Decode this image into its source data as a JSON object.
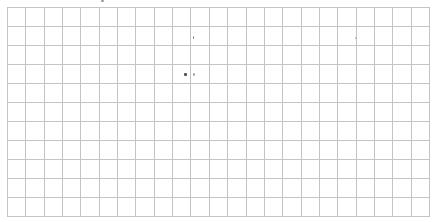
{
  "canvas": {
    "width": 434,
    "height": 222,
    "background": "#ffffff"
  },
  "grid": {
    "line_color": "#c4c4c4",
    "origin_x": 7,
    "origin_y": 7,
    "end_x": 429,
    "end_y": 216,
    "columns": 23,
    "rows": 11
  },
  "marks": [
    {
      "x": 101,
      "y": 0,
      "w": 3,
      "h": 2,
      "color": "#9a9a9a"
    },
    {
      "x": 193,
      "y": 36,
      "w": 1,
      "h": 3,
      "color": "#8a8a8a"
    },
    {
      "x": 355,
      "y": 37,
      "w": 2,
      "h": 2,
      "color": "#b5b5b5"
    },
    {
      "x": 184,
      "y": 73,
      "w": 3,
      "h": 3,
      "color": "#555555"
    },
    {
      "x": 193,
      "y": 73,
      "w": 2,
      "h": 3,
      "color": "#a8a8a8"
    }
  ]
}
